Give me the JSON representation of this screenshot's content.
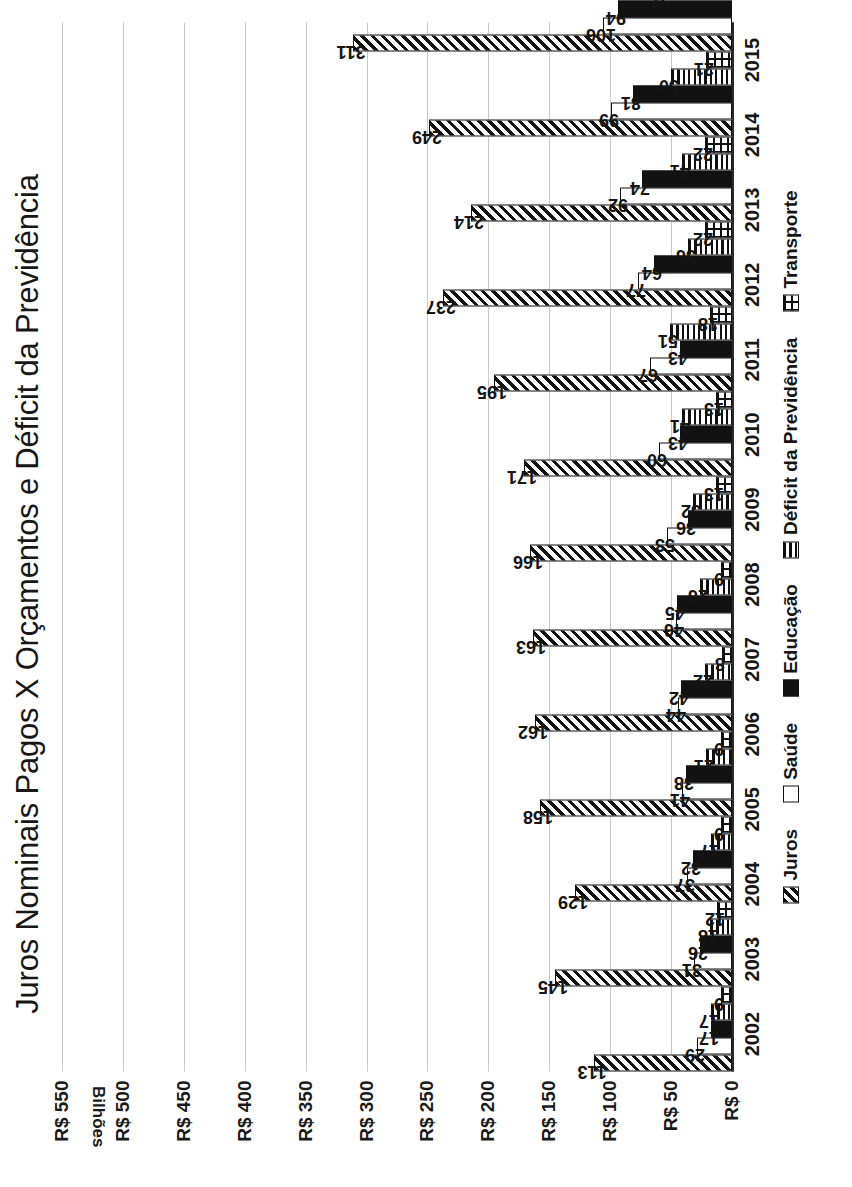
{
  "chart_data": {
    "type": "bar",
    "title": "Juros Nominais Pagos X Orçamentos e Déficit da Previdência",
    "subtitle": "",
    "xlabel": "",
    "ylabel": "Bilhões",
    "axis_unit_label": "Bilhões",
    "orientation": "vertical-bars-rendered-rotated-90",
    "grid": true,
    "legend_position": "bottom",
    "ylim": [
      0,
      550
    ],
    "ytick_step": 50,
    "ytick_labels": [
      "R$ 550",
      "R$ 500",
      "R$ 450",
      "R$ 400",
      "R$ 350",
      "R$ 300",
      "R$ 250",
      "R$ 200",
      "R$ 150",
      "R$ 100",
      "R$ 50",
      "R$ 0"
    ],
    "ytick_values": [
      550,
      500,
      450,
      400,
      350,
      300,
      250,
      200,
      150,
      100,
      50,
      0
    ],
    "categories": [
      "2002",
      "2003",
      "2004",
      "2005",
      "2006",
      "2007",
      "2008",
      "2009",
      "2010",
      "2011",
      "2012",
      "2013",
      "2014",
      "2015"
    ],
    "series": [
      {
        "name": "Juros",
        "pattern": "diagonal-hatch",
        "values": [
          113,
          145,
          129,
          158,
          162,
          163,
          166,
          171,
          195,
          237,
          214,
          249,
          311,
          502
        ]
      },
      {
        "name": "Saúde",
        "pattern": "white-solid",
        "values": [
          29,
          31,
          37,
          41,
          44,
          46,
          53,
          60,
          67,
          77,
          92,
          99,
          106,
          121
        ]
      },
      {
        "name": "Educação",
        "pattern": "black-solid",
        "values": [
          17,
          26,
          32,
          38,
          42,
          45,
          36,
          43,
          43,
          64,
          74,
          81,
          94,
          103
        ]
      },
      {
        "name": "Déficit da Previdência",
        "pattern": "horizontal-lines",
        "values": [
          17,
          18,
          17,
          21,
          22,
          26,
          32,
          41,
          51,
          36,
          41,
          50,
          57,
          86
        ]
      },
      {
        "name": "Transporte",
        "pattern": "grid-crosshatch",
        "values": [
          9,
          12,
          9,
          9,
          8,
          9,
          13,
          13,
          18,
          22,
          22,
          21,
          21,
          20
        ]
      }
    ],
    "colors": {
      "ink": "#111111",
      "background": "#ffffff",
      "gridline": "#c9c9c9",
      "axis": "#2b2b2b"
    }
  },
  "legend": {
    "items": [
      {
        "label": "Juros",
        "swatch": "p-juros"
      },
      {
        "label": "Saúde",
        "swatch": "p-saude"
      },
      {
        "label": "Educação",
        "swatch": "p-educacao"
      },
      {
        "label": "Déficit da Previdência",
        "swatch": "p-deficit"
      },
      {
        "label": "Transporte",
        "swatch": "p-transporte"
      }
    ]
  }
}
